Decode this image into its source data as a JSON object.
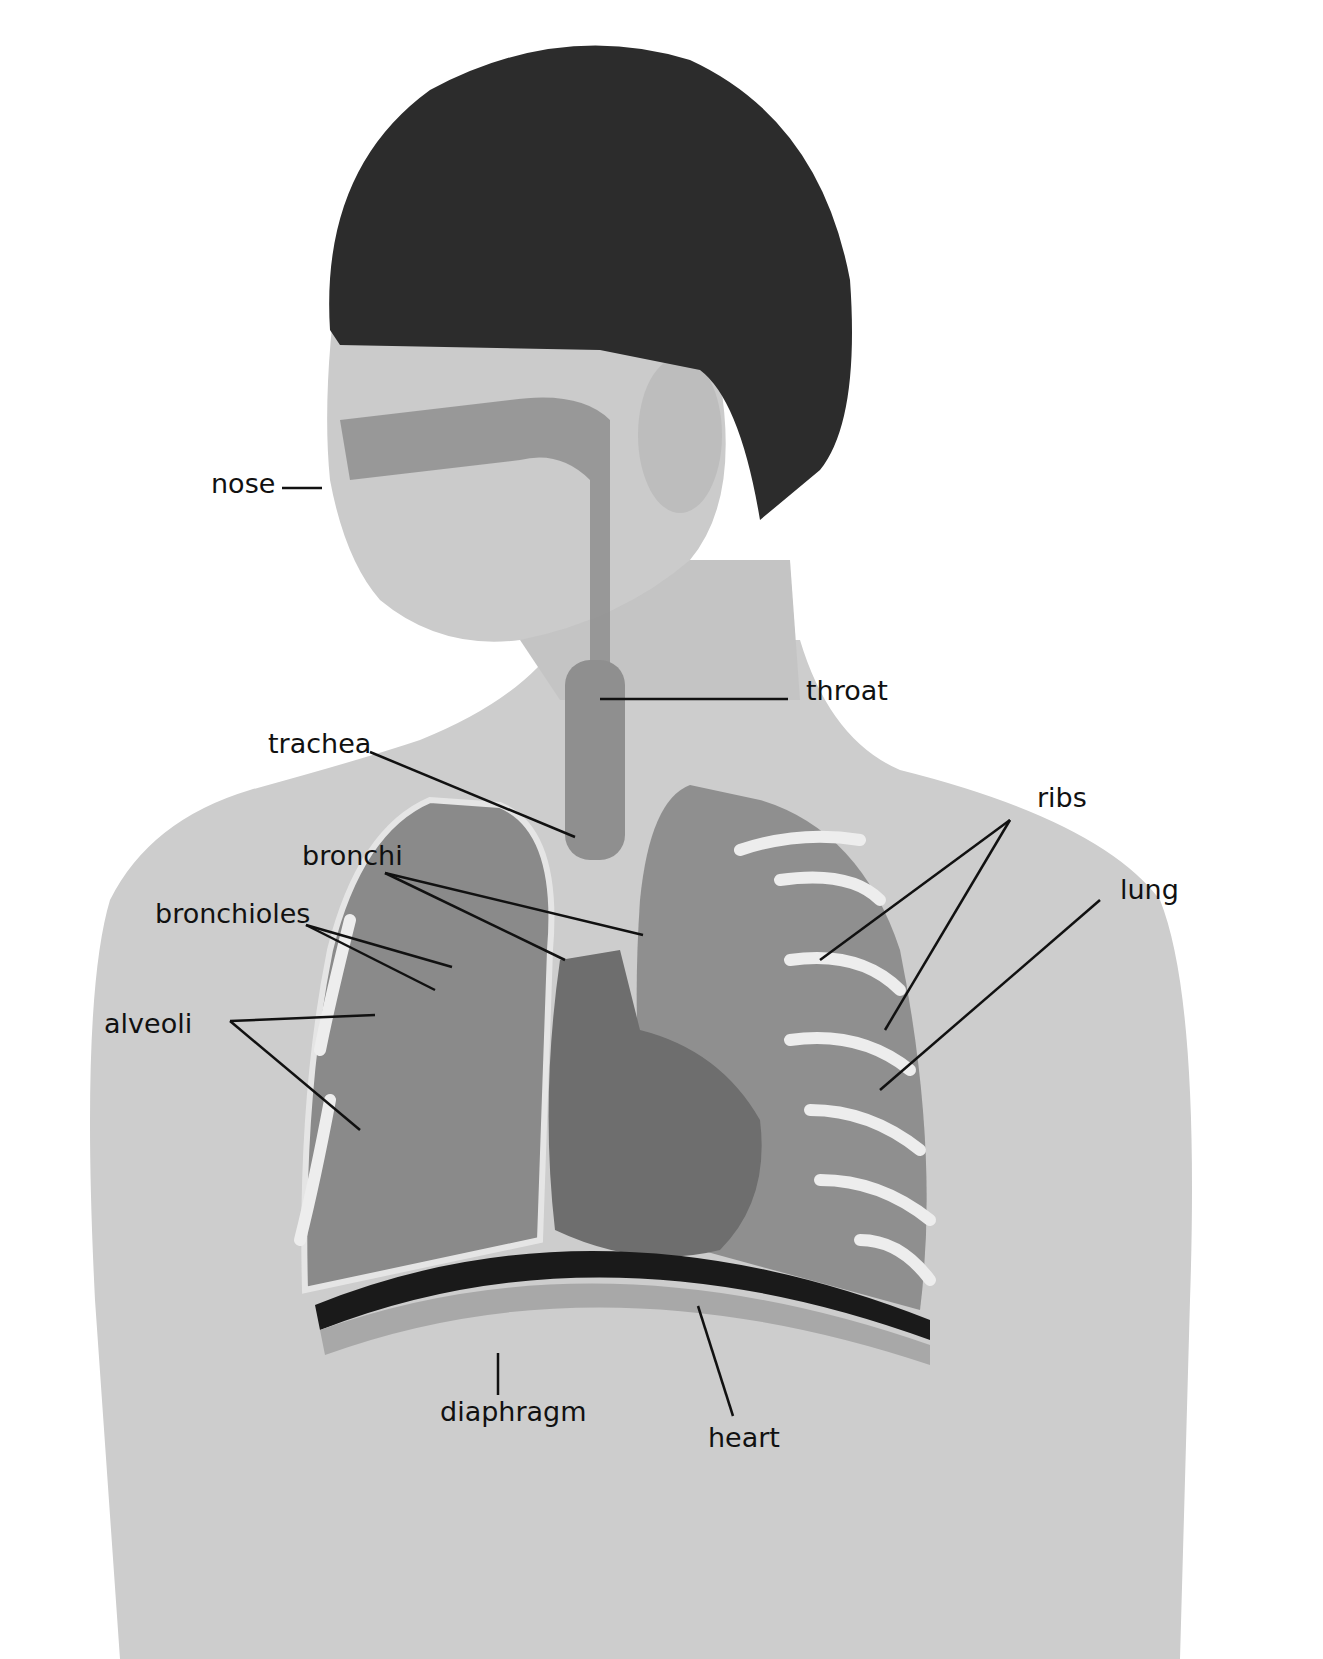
{
  "diagram": {
    "labels": [
      {
        "id": "nose",
        "text": "nose"
      },
      {
        "id": "throat",
        "text": "throat"
      },
      {
        "id": "trachea",
        "text": "trachea"
      },
      {
        "id": "ribs",
        "text": "ribs"
      },
      {
        "id": "bronchi",
        "text": "bronchi"
      },
      {
        "id": "lung",
        "text": "lung"
      },
      {
        "id": "bronchioles",
        "text": "bronchioles"
      },
      {
        "id": "alveoli",
        "text": "alveoli"
      },
      {
        "id": "diaphragm",
        "text": "diaphragm"
      },
      {
        "id": "heart",
        "text": "heart"
      }
    ]
  },
  "colors": {
    "background": "#ffffff",
    "skin": "#c9c9c9",
    "skin_shadow": "#a9a9a9",
    "hair": "#2a2a2a",
    "airway": "#8f8f8f",
    "lung": "#8a8a8a",
    "heart": "#6e6e6e",
    "rib": "#ededed",
    "diaphragm": "#1a1a1a",
    "leader_line": "#111111",
    "label_text": "#111111"
  }
}
